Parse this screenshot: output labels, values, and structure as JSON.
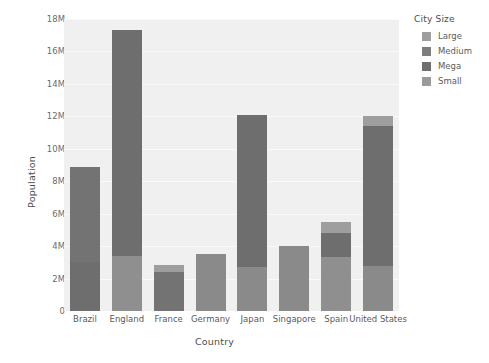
{
  "chart_data": {
    "type": "bar",
    "title": "",
    "xlabel": "Country",
    "ylabel": "Population",
    "stacked": true,
    "grid": true,
    "legend_position": "right",
    "ylim": [
      0,
      18000000
    ],
    "yticks": [
      {
        "value": 0,
        "label": "0"
      },
      {
        "value": 2000000,
        "label": "2M"
      },
      {
        "value": 4000000,
        "label": "4M"
      },
      {
        "value": 6000000,
        "label": "6M"
      },
      {
        "value": 8000000,
        "label": "8M"
      },
      {
        "value": 10000000,
        "label": "10M"
      },
      {
        "value": 12000000,
        "label": "12M"
      },
      {
        "value": 14000000,
        "label": "14M"
      },
      {
        "value": 16000000,
        "label": "16M"
      },
      {
        "value": 18000000,
        "label": "18M"
      }
    ],
    "categories": [
      "Brazil",
      "England",
      "France",
      "Germany",
      "Japan",
      "Singapore",
      "Spain",
      "United States"
    ],
    "legend_title": "City Size",
    "series": [
      {
        "name": "Large",
        "color": "#9a9a9a",
        "values": [
          0,
          0,
          450000,
          0,
          0,
          0,
          700000,
          650000
        ]
      },
      {
        "name": "Medium",
        "color": "#7a7a7a",
        "values": [
          5900000,
          13900000,
          0,
          0,
          9400000,
          0,
          1450000,
          8600000
        ]
      },
      {
        "name": "Mega",
        "color": "#6e6e6e",
        "values": [
          3000000,
          0,
          2400000,
          3500000,
          0,
          4000000,
          0,
          0
        ]
      },
      {
        "name": "Small",
        "color": "#8f8f8f",
        "values": [
          0,
          3400000,
          0,
          0,
          2700000,
          0,
          3350000,
          2800000
        ]
      }
    ],
    "bar_totals": [
      8900000,
      17300000,
      2850000,
      3500000,
      12100000,
      4000000,
      5500000,
      12050000
    ],
    "bar_stacks": [
      {
        "country": "Brazil",
        "segments": [
          {
            "size": "Mega",
            "from": 0,
            "to": 3000000,
            "color": "#6e6e6e"
          },
          {
            "size": "Medium",
            "from": 3000000,
            "to": 8900000,
            "color": "#737373"
          }
        ]
      },
      {
        "country": "England",
        "segments": [
          {
            "size": "Small",
            "from": 0,
            "to": 3400000,
            "color": "#8f8f8f"
          },
          {
            "size": "Medium",
            "from": 3400000,
            "to": 17300000,
            "color": "#6e6e6e"
          }
        ]
      },
      {
        "country": "France",
        "segments": [
          {
            "size": "Mega",
            "from": 0,
            "to": 2400000,
            "color": "#737373"
          },
          {
            "size": "Large",
            "from": 2400000,
            "to": 2850000,
            "color": "#9e9e9e"
          }
        ]
      },
      {
        "country": "Germany",
        "segments": [
          {
            "size": "Mega",
            "from": 0,
            "to": 3500000,
            "color": "#8a8a8a"
          }
        ]
      },
      {
        "country": "Japan",
        "segments": [
          {
            "size": "Small",
            "from": 0,
            "to": 2700000,
            "color": "#8a8a8a"
          },
          {
            "size": "Medium",
            "from": 2700000,
            "to": 12100000,
            "color": "#6e6e6e"
          }
        ]
      },
      {
        "country": "Singapore",
        "segments": [
          {
            "size": "Mega",
            "from": 0,
            "to": 4000000,
            "color": "#8a8a8a"
          }
        ]
      },
      {
        "country": "Spain",
        "segments": [
          {
            "size": "Small",
            "from": 0,
            "to": 3350000,
            "color": "#8f8f8f"
          },
          {
            "size": "Medium",
            "from": 3350000,
            "to": 4800000,
            "color": "#6e6e6e"
          },
          {
            "size": "Large",
            "from": 4800000,
            "to": 5500000,
            "color": "#9e9e9e"
          }
        ]
      },
      {
        "country": "United States",
        "segments": [
          {
            "size": "Small",
            "from": 0,
            "to": 2800000,
            "color": "#8a8a8a"
          },
          {
            "size": "Medium",
            "from": 2800000,
            "to": 11400000,
            "color": "#6e6e6e"
          },
          {
            "size": "Large",
            "from": 11400000,
            "to": 12050000,
            "color": "#9e9e9e"
          }
        ]
      }
    ]
  },
  "legend": {
    "title": "City Size",
    "items": [
      {
        "label": "Large",
        "color": "#9e9e9e"
      },
      {
        "label": "Medium",
        "color": "#7d7d7d"
      },
      {
        "label": "Mega",
        "color": "#6e6e6e"
      },
      {
        "label": "Small",
        "color": "#9a9a9a"
      }
    ]
  },
  "style": {
    "plot_background": "#f0f0f0",
    "gridline_color": "#fafafa",
    "page_background": "#ffffff",
    "tick_color": "#6b6b6b",
    "axis_title_color": "#4d4d4d"
  }
}
